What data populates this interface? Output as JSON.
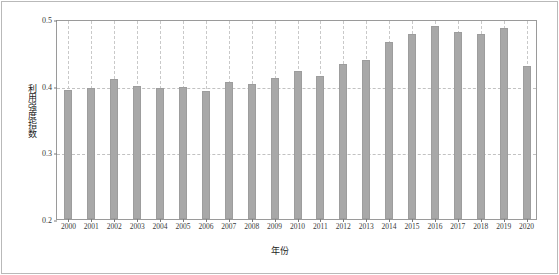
{
  "chart_data": {
    "type": "bar",
    "title": "",
    "xlabel": "年份",
    "ylabel": "利用强度指数",
    "categories": [
      "2000",
      "2001",
      "2002",
      "2003",
      "2004",
      "2005",
      "2006",
      "2007",
      "2008",
      "2009",
      "2010",
      "2011",
      "2012",
      "2013",
      "2014",
      "2015",
      "2016",
      "2017",
      "2018",
      "2019",
      "2020"
    ],
    "values": [
      0.393,
      0.397,
      0.41,
      0.399,
      0.396,
      0.398,
      0.392,
      0.405,
      0.403,
      0.411,
      0.422,
      0.415,
      0.432,
      0.439,
      0.466,
      0.477,
      0.489,
      0.481,
      0.478,
      0.487,
      0.43
    ],
    "ylim": [
      0.2,
      0.5
    ],
    "yticks": [
      0.2,
      0.3,
      0.4,
      0.5
    ],
    "ytick_labels": [
      "0.2",
      "0.3",
      "0.4",
      "0.5"
    ],
    "xtick_labels": [
      "2000",
      "2001",
      "2002",
      "2003",
      "2004",
      "2005",
      "2006",
      "2007",
      "2008",
      "2009",
      "2010",
      "2011",
      "2012",
      "2013",
      "2014",
      "2015",
      "2016",
      "2017",
      "2018",
      "2019",
      "2020"
    ],
    "grid": {
      "horizontal": true,
      "vertical": true,
      "style": "dashed",
      "color": "#c4c4c4"
    },
    "legend": null,
    "bar_color": "#a8a8a8",
    "bar_edge_color": "#9d9d9d",
    "axis_color": "#9a9a9a",
    "text_color": "#1d1d1d"
  }
}
